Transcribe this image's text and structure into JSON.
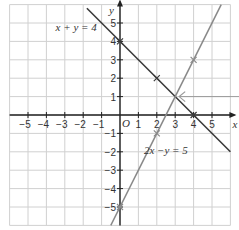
{
  "chart_data": {
    "type": "line",
    "title": "",
    "xlabel": "x",
    "ylabel": "y",
    "origin_label": "O",
    "xlim": [
      -6,
      6
    ],
    "ylim": [
      -6,
      6
    ],
    "grid": true,
    "x_ticks": [
      -5,
      -4,
      -3,
      -2,
      -1,
      1,
      2,
      3,
      4,
      5
    ],
    "y_ticks": [
      5,
      4,
      3,
      2,
      1,
      -1,
      -2,
      -3,
      -4,
      -5
    ],
    "series": [
      {
        "name": "x + y = 4",
        "equation": "y = 4 - x",
        "color": "#3a3a3a",
        "marked_points": [
          [
            0,
            4
          ],
          [
            2,
            2
          ],
          [
            4,
            0
          ]
        ]
      },
      {
        "name": "2x - y = 5",
        "equation": "y = 2x - 5",
        "color": "#8a8a8a",
        "marked_points": [
          [
            2,
            -1
          ],
          [
            4,
            3
          ],
          [
            0,
            -5
          ]
        ]
      }
    ],
    "annotations": [
      {
        "text": "intersection arrow",
        "points_to": [
          3,
          1
        ]
      }
    ],
    "labels": {
      "line1": "x + y = 4",
      "line2": "2x −y = 5"
    }
  }
}
